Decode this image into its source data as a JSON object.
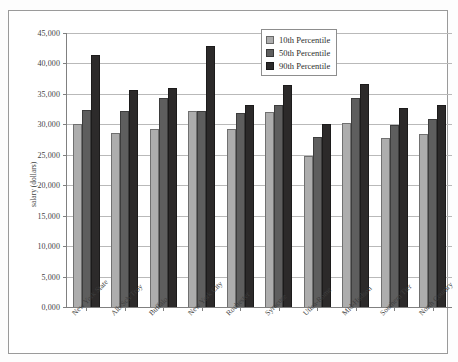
{
  "chart_data": {
    "type": "bar",
    "title": "",
    "subtitle": "",
    "xlabel": "",
    "ylabel": "salary (dollars)",
    "ylim": [
      0,
      45000
    ],
    "ytick_step": 5000,
    "ytick_labels": [
      "0,000",
      "5,000",
      "10,000",
      "15,000",
      "20,000",
      "25,000",
      "30,000",
      "35,000",
      "40,000",
      "45,000"
    ],
    "ytick_values": [
      0,
      5000,
      10000,
      15000,
      20000,
      25000,
      30000,
      35000,
      40000,
      45000
    ],
    "grid": true,
    "grid_axis": "y",
    "legend_position": "top-right",
    "categories": [
      "New York State",
      "Alb/Sch/Troy",
      "Buffalo",
      "New York City",
      "Rochester",
      "Syracuse",
      "Utica-Rome",
      "Mid-Hudson",
      "Southern Tier",
      "North Country"
    ],
    "series": [
      {
        "name": "10th Percentile",
        "color": "#adadad",
        "values": [
          30000,
          28500,
          29300,
          32200,
          29200,
          32000,
          24800,
          30300,
          27800,
          28400
        ]
      },
      {
        "name": "50th Percentile",
        "color": "#5e5e5e",
        "values": [
          32300,
          32200,
          34300,
          32200,
          31900,
          33100,
          28000,
          34400,
          29900,
          30900
        ]
      },
      {
        "name": "90th Percentile",
        "color": "#2c2a2a",
        "values": [
          41400,
          35700,
          35900,
          42800,
          33100,
          36500,
          30100,
          36700,
          32700,
          33100
        ]
      }
    ]
  },
  "legend": {
    "items": [
      {
        "label": "10th Percentile",
        "color": "#adadad"
      },
      {
        "label": "50th Percentile",
        "color": "#5e5e5e"
      },
      {
        "label": "90th Percentile",
        "color": "#2c2a2a"
      }
    ]
  }
}
